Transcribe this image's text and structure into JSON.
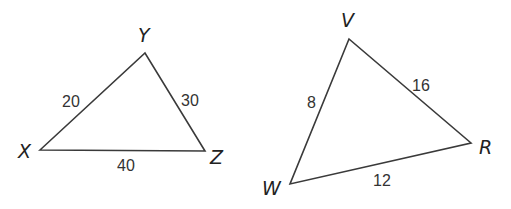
{
  "triangles": [
    {
      "name": "XYZ",
      "vertices": {
        "X": {
          "label": "X",
          "x": 40,
          "y": 150,
          "lx": 18,
          "ly": 158
        },
        "Y": {
          "label": "Y",
          "x": 145,
          "y": 53,
          "lx": 138,
          "ly": 42
        },
        "Z": {
          "label": "Z",
          "x": 205,
          "y": 151,
          "lx": 210,
          "ly": 164
        }
      },
      "sides": {
        "XY": {
          "label": "20",
          "x": 62,
          "y": 107
        },
        "YZ": {
          "label": "30",
          "x": 181,
          "y": 106
        },
        "XZ": {
          "label": "40",
          "x": 117,
          "y": 171
        }
      }
    },
    {
      "name": "VWR",
      "vertices": {
        "V": {
          "label": "V",
          "x": 349,
          "y": 39,
          "lx": 341,
          "ly": 27
        },
        "W": {
          "label": "W",
          "x": 290,
          "y": 184,
          "lx": 262,
          "ly": 195
        },
        "R": {
          "label": "R",
          "x": 471,
          "y": 143,
          "lx": 479,
          "ly": 154
        }
      },
      "sides": {
        "VW": {
          "label": "8",
          "x": 307,
          "y": 108
        },
        "VR": {
          "label": "16",
          "x": 412,
          "y": 91
        },
        "WR": {
          "label": "12",
          "x": 373,
          "y": 186
        }
      }
    }
  ]
}
